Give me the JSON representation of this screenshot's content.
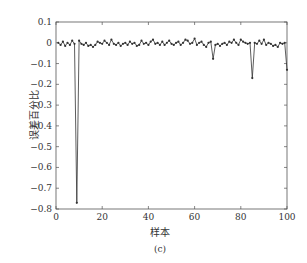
{
  "chart_data": {
    "type": "line",
    "title": "",
    "caption": "(c)",
    "xlabel": "样本",
    "ylabel": "误差百分比",
    "xlim": [
      0,
      100
    ],
    "ylim": [
      -0.8,
      0.1
    ],
    "xticks": [
      0,
      20,
      40,
      60,
      80,
      100
    ],
    "yticks": [
      0.1,
      0,
      -0.1,
      -0.2,
      -0.3,
      -0.4,
      -0.5,
      -0.6,
      -0.7,
      -0.8
    ],
    "ytick_labels": [
      "0.1",
      "0",
      "−0.1",
      "−0.2",
      "−0.3",
      "−0.4",
      "−0.5",
      "−0.6",
      "−0.7",
      "−0.8"
    ],
    "grid": false,
    "legend": null,
    "series": [
      {
        "name": "误差百分比",
        "marker": "dot",
        "color": "#333333",
        "x": [
          1,
          2,
          3,
          4,
          5,
          6,
          7,
          8,
          9,
          10,
          11,
          12,
          13,
          14,
          15,
          16,
          17,
          18,
          19,
          20,
          21,
          22,
          23,
          24,
          25,
          26,
          27,
          28,
          29,
          30,
          31,
          32,
          33,
          34,
          35,
          36,
          37,
          38,
          39,
          40,
          41,
          42,
          43,
          44,
          45,
          46,
          47,
          48,
          49,
          50,
          51,
          52,
          53,
          54,
          55,
          56,
          57,
          58,
          59,
          60,
          61,
          62,
          63,
          64,
          65,
          66,
          67,
          68,
          69,
          70,
          71,
          72,
          73,
          74,
          75,
          76,
          77,
          78,
          79,
          80,
          81,
          82,
          83,
          84,
          85,
          86,
          87,
          88,
          89,
          90,
          91,
          92,
          93,
          94,
          95,
          96,
          97,
          98,
          99,
          100
        ],
        "values": [
          0.0,
          -0.01,
          0.005,
          -0.015,
          0.0,
          -0.01,
          0.01,
          -0.005,
          -0.77,
          0.01,
          -0.005,
          -0.01,
          0.0,
          -0.015,
          -0.01,
          -0.02,
          -0.01,
          0.005,
          0.0,
          -0.005,
          0.01,
          0.0,
          -0.01,
          0.015,
          -0.005,
          -0.01,
          0.0,
          -0.015,
          -0.005,
          0.0,
          -0.01,
          0.005,
          -0.005,
          0.0,
          -0.015,
          -0.01,
          0.01,
          -0.005,
          0.0,
          -0.01,
          0.005,
          0.015,
          -0.005,
          0.0,
          -0.01,
          0.005,
          -0.01,
          0.0,
          0.01,
          -0.005,
          -0.01,
          0.0,
          0.005,
          -0.01,
          0.0,
          0.015,
          0.01,
          -0.005,
          0.0,
          0.02,
          -0.01,
          0.0,
          0.005,
          -0.01,
          -0.02,
          0.0,
          0.005,
          -0.077,
          -0.01,
          -0.005,
          -0.015,
          -0.005,
          0.0,
          -0.01,
          0.005,
          0.0,
          0.015,
          0.0,
          -0.01,
          0.015,
          0.005,
          0.0,
          -0.005,
          0.0,
          -0.17,
          0.0,
          -0.005,
          0.01,
          -0.005,
          0.015,
          -0.01,
          0.0,
          -0.005,
          -0.015,
          -0.01,
          -0.02,
          0.0,
          -0.005,
          0.0,
          -0.13
        ]
      }
    ]
  },
  "labels": {
    "xlabel": "样本",
    "ylabel": "误差百分比",
    "caption": "(c)"
  }
}
